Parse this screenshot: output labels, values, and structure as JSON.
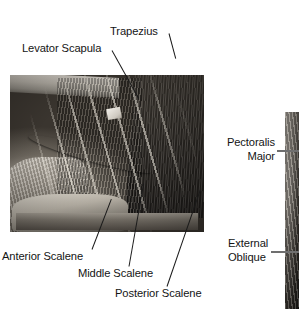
{
  "figure": {
    "background_color": "#ffffff",
    "text_color": "#141414",
    "leader_line_color": "#1a1a1a",
    "right_leader_color": "#6f6f6f"
  },
  "images": {
    "main": {
      "name": "neck-dissection-photo",
      "caption": "Grayscale cadaveric dissection showing the posterior cervical triangle, scalene muscles, brachial plexus and trapezius"
    },
    "right": {
      "name": "torso-dissection-photo",
      "caption": "Partially visible grayscale dissection of the anterior trunk at the right edge"
    }
  },
  "labels": {
    "trapezius": "Trapezius",
    "levator_scapula": "Levator Scapula",
    "anterior_scalene": "Anterior Scalene",
    "middle_scalene": "Middle Scalene",
    "posterior_scalene": "Posterior Scalene",
    "pectoralis_major_line1": "Pectoralis",
    "pectoralis_major_line2": "Major",
    "external_oblique_line1": "External",
    "external_oblique_line2": "Oblique"
  }
}
